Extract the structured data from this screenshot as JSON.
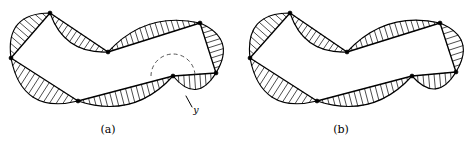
{
  "figure": {
    "background_color": "#ffffff",
    "stroke_color": "#000000",
    "hatch_color": "#111111",
    "dashed_color": "#555555",
    "width": 466,
    "height": 141
  },
  "panels": [
    {
      "id": "a",
      "caption": "(a)",
      "caption_x": 108,
      "caption_y": 133,
      "origin_x": 0,
      "has_dashed_arc": true,
      "has_pointer_label": true,
      "pointer_label": "y",
      "pointer_label_x": 196,
      "pointer_label_y": 113,
      "pointer_from_x": 192,
      "pointer_from_y": 107,
      "pointer_to_x": 186,
      "pointer_to_y": 96,
      "dashed_arc_cx": 173,
      "dashed_arc_cy": 76,
      "dashed_arc_r": 22,
      "vertices": [
        {
          "x": 50,
          "y": 13
        },
        {
          "x": 11,
          "y": 58
        },
        {
          "x": 78,
          "y": 101
        },
        {
          "x": 173,
          "y": 76
        },
        {
          "x": 216,
          "y": 73
        },
        {
          "x": 200,
          "y": 23
        },
        {
          "x": 108,
          "y": 52
        }
      ],
      "curve_control_offsets": [
        {
          "edge": 0,
          "bulge": -17
        },
        {
          "edge": 1,
          "bulge": -21
        },
        {
          "edge": 2,
          "bulge": -16
        },
        {
          "edge": 3,
          "bulge": -15
        },
        {
          "edge": 4,
          "bulge": -15
        },
        {
          "edge": 5,
          "bulge": -14
        },
        {
          "edge": 6,
          "bulge": -13
        }
      ]
    },
    {
      "id": "b",
      "caption": "(b)",
      "caption_x": 341,
      "caption_y": 133,
      "origin_x": 233,
      "has_dashed_arc": false,
      "has_pointer_label": false,
      "pointer_label": "",
      "vertices": [
        {
          "x": 290,
          "y": 13
        },
        {
          "x": 250,
          "y": 58
        },
        {
          "x": 317,
          "y": 101
        },
        {
          "x": 412,
          "y": 76
        },
        {
          "x": 456,
          "y": 72
        },
        {
          "x": 440,
          "y": 23
        },
        {
          "x": 347,
          "y": 52
        }
      ],
      "curve_control_offsets": [
        {
          "edge": 0,
          "bulge": -17
        },
        {
          "edge": 1,
          "bulge": -21
        },
        {
          "edge": 2,
          "bulge": -16
        },
        {
          "edge": 3,
          "bulge": -15
        },
        {
          "edge": 4,
          "bulge": -15
        },
        {
          "edge": 5,
          "bulge": -14
        },
        {
          "edge": 6,
          "bulge": -13
        }
      ]
    }
  ],
  "hatching": {
    "spacing_px": 5.5,
    "description": "parallel tick marks filling the lune between each polygon chord and the curve arc"
  }
}
